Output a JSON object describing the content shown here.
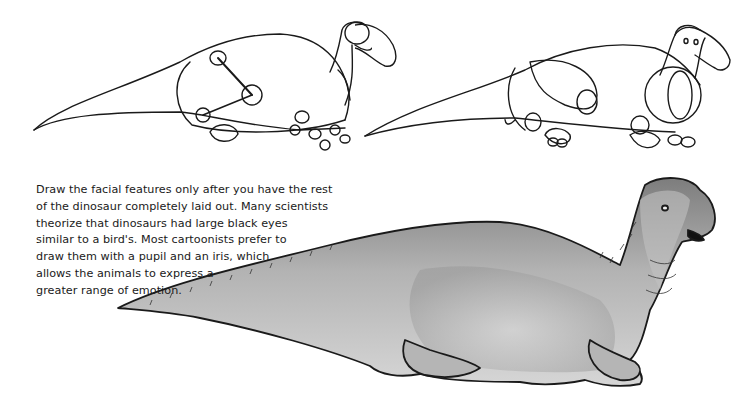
{
  "page": {
    "caption_lines": [
      "Draw the facial features only after you have the rest",
      "of the dinosaur completely laid out. Many scientists",
      "theorize that dinosaurs had large black eyes",
      "similar to a bird's. Most cartoonists prefer to",
      "draw them with a pupil and an iris, which",
      "allows the animals to express a",
      "greater range of emotion."
    ],
    "illustrations": [
      {
        "name": "step-1-skeleton-sketch",
        "description": "basic oval body with tail, neck, head and joint circles"
      },
      {
        "name": "step-2-construction-sketch",
        "description": "refined body shapes, legs and head outline"
      },
      {
        "name": "step-3-finished-shaded-dinosaur",
        "description": "finished gray-shaded hadrosaur lying down with open mouth"
      }
    ],
    "colors": {
      "ink": "#1a1a1a",
      "shade_light": "#cfcfcf",
      "shade_mid": "#a9a9a9",
      "shade_dark": "#7d7d7d",
      "mouth": "#111111"
    }
  }
}
